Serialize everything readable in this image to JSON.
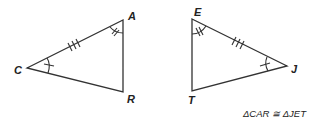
{
  "figure": {
    "triangle_left": {
      "vertices": {
        "C": "C",
        "A": "A",
        "R": "R"
      }
    },
    "triangle_right": {
      "vertices": {
        "E": "E",
        "J": "J",
        "T": "T"
      }
    },
    "caption": "ΔCAR ≅ ΔJET"
  }
}
